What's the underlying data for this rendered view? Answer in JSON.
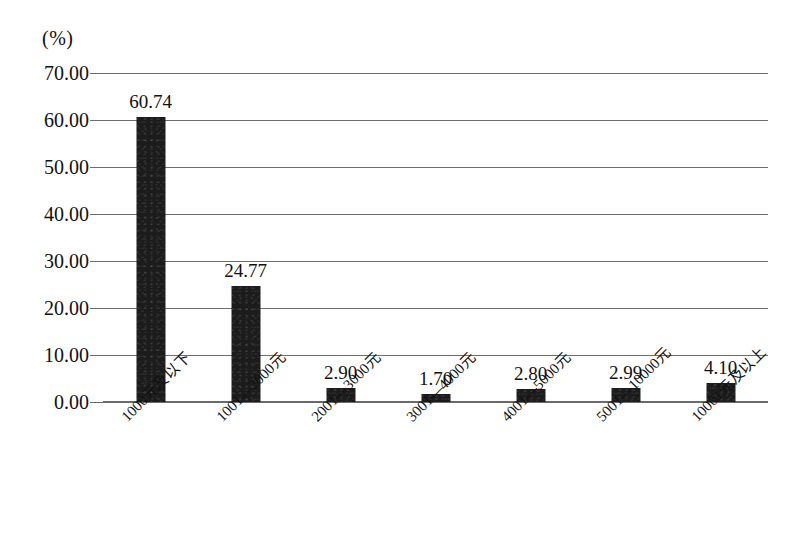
{
  "chart_data": {
    "type": "bar",
    "title": "",
    "subtitle": "",
    "xlabel": "",
    "ylabel": "",
    "unit_label": "(%)",
    "categories": [
      "1000元及以下",
      "1001—2000元",
      "2001—3000元",
      "3001—4000元",
      "4001—5000元",
      "5001—10000元",
      "10001元及以上"
    ],
    "values": [
      60.74,
      24.77,
      2.9,
      1.7,
      2.8,
      2.99,
      4.1
    ],
    "value_labels": [
      "60.74",
      "24.77",
      "2.90",
      "1.70",
      "2.80",
      "2.99",
      "4.10"
    ],
    "ylim": [
      0,
      70
    ],
    "ytick_step": 10,
    "ytick_labels": [
      "70.00",
      "60.00",
      "50.00",
      "40.00",
      "30.00",
      "20.00",
      "10.00",
      "0.00"
    ],
    "ytick_values": [
      70,
      60,
      50,
      40,
      30,
      20,
      10,
      0
    ],
    "grid": true,
    "grid_axis": "y",
    "legend": false,
    "legend_position": "none",
    "series": [
      {
        "name": "",
        "values": [
          60.74,
          24.77,
          2.9,
          1.7,
          2.8,
          2.99,
          4.1
        ]
      }
    ],
    "colors": {
      "bar": "#1c1c1c",
      "gridline": "#6d6d6d",
      "axis": "#6a6a6a",
      "text": "#111111",
      "background": "#ffffff"
    }
  }
}
